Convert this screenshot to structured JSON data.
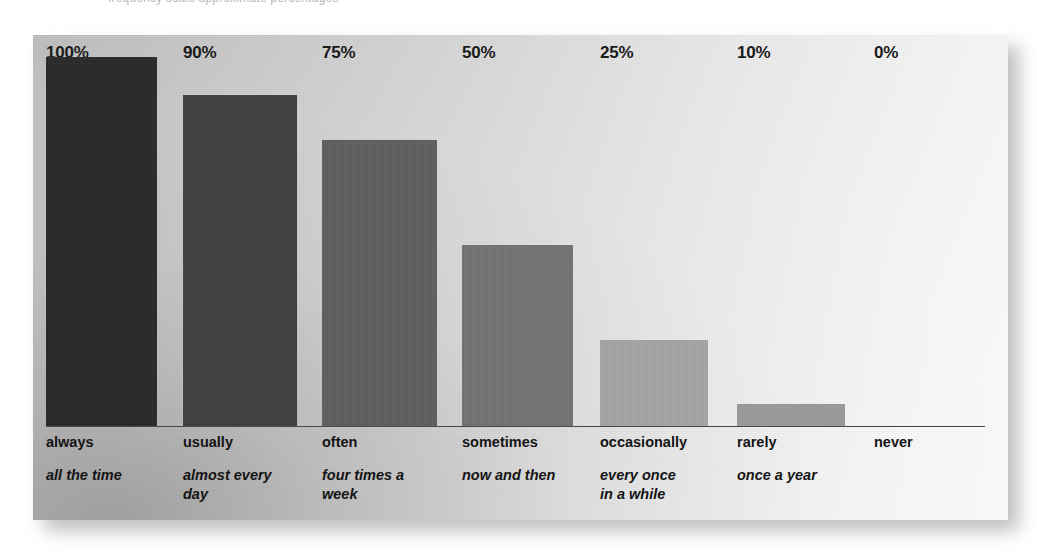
{
  "caption": {
    "clipped_text": "frequency scale approximate percentages"
  },
  "chart_data": {
    "type": "bar",
    "title": "",
    "subtitle": "",
    "xlabel": "",
    "ylabel": "",
    "ylim": [
      0,
      100
    ],
    "grid": false,
    "legend": "none",
    "orientation": "vertical",
    "value_label_position": "above-bar",
    "categories": [
      "always",
      "usually",
      "often",
      "sometimes",
      "occasionally",
      "rarely",
      "never"
    ],
    "category_glosses": [
      "all the time",
      "almost every day",
      "four times a week",
      "now and then",
      "every once in a while",
      "once a year",
      ""
    ],
    "values": [
      100,
      90,
      75,
      50,
      25,
      10,
      0
    ],
    "value_labels": [
      "100%",
      "90%",
      "75%",
      "50%",
      "25%",
      "10%",
      "0%"
    ],
    "bar_colors": [
      "#262626",
      "#3d3d3d",
      "#5e5e5e",
      "#737373",
      "#a8a8a8",
      "#9e9e9e",
      "#00000000"
    ],
    "bars": [
      {
        "category": "always",
        "gloss": "all the time",
        "value": 100,
        "value_label": "100%",
        "color": "#262626",
        "x": 13,
        "width": 111,
        "top": 22,
        "height": 369,
        "label_x": 13,
        "gloss_lines": [
          "all the time"
        ]
      },
      {
        "category": "usually",
        "gloss": "almost every day",
        "value": 90,
        "value_label": "90%",
        "color": "#3d3d3d",
        "x": 150,
        "width": 114,
        "top": 60,
        "height": 331,
        "label_x": 150,
        "gloss_lines": [
          "almost every",
          "day"
        ]
      },
      {
        "category": "often",
        "gloss": "four times a week",
        "value": 75,
        "value_label": "75%",
        "color": "#5e5e5e",
        "x": 289,
        "width": 115,
        "top": 105,
        "height": 286,
        "label_x": 289,
        "gloss_lines": [
          "four times a",
          "week"
        ]
      },
      {
        "category": "sometimes",
        "gloss": "now and then",
        "value": 50,
        "value_label": "50%",
        "color": "#737373",
        "x": 429,
        "width": 111,
        "top": 210,
        "height": 181,
        "label_x": 429,
        "gloss_lines": [
          "now and then"
        ]
      },
      {
        "category": "occasionally",
        "gloss": "every once in a while",
        "value": 25,
        "value_label": "25%",
        "color": "#a8a8a8",
        "x": 567,
        "width": 108,
        "top": 305,
        "height": 86,
        "label_x": 567,
        "gloss_lines": [
          "every once",
          "in a while"
        ]
      },
      {
        "category": "rarely",
        "gloss": "once a year",
        "value": 10,
        "value_label": "10%",
        "color": "#9e9e9e",
        "x": 704,
        "width": 108,
        "top": 369,
        "height": 22,
        "label_x": 704,
        "gloss_lines": [
          "once a year"
        ]
      },
      {
        "category": "never",
        "gloss": "",
        "value": 0,
        "value_label": "0%",
        "color": "transparent",
        "x": 841,
        "width": 0,
        "top": 391,
        "height": 0,
        "label_x": 841,
        "gloss_lines": []
      }
    ],
    "axis": {
      "baseline_y": 391,
      "baseline_x_start": 13,
      "baseline_x_end": 952,
      "color": "#4a4a4a"
    }
  },
  "style": {
    "panel_bg_dark": "#bebebe",
    "panel_bg_light": "#fdfdfd",
    "text_color": "#141414",
    "label_color": "#1b1b1b"
  }
}
